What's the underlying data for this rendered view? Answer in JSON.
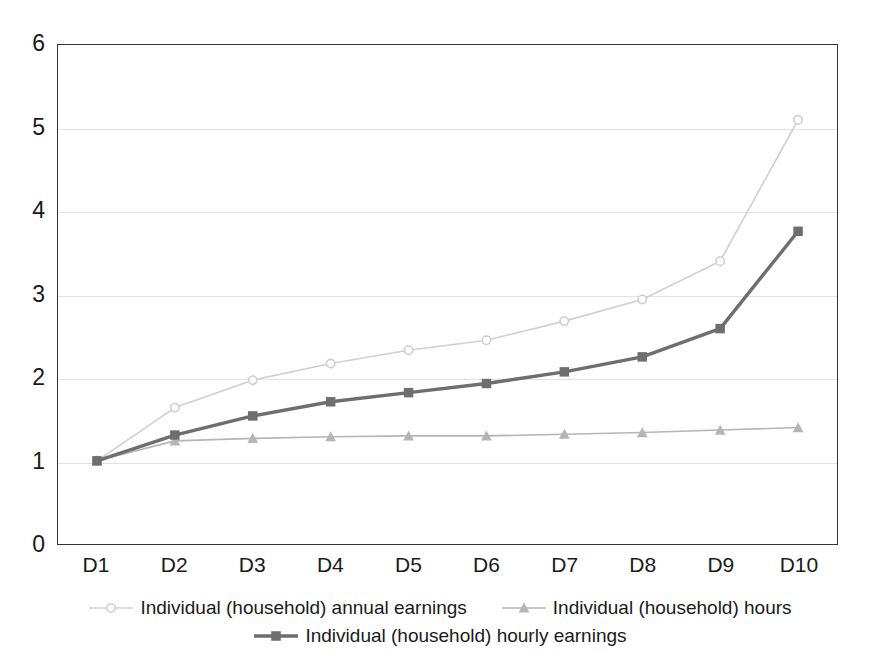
{
  "chart_data": {
    "type": "line",
    "title": "",
    "subtitle": "",
    "xlabel": "",
    "ylabel": "",
    "categories": [
      "D1",
      "D2",
      "D3",
      "D4",
      "D5",
      "D6",
      "D7",
      "D8",
      "D9",
      "D10"
    ],
    "ylim": [
      0,
      6
    ],
    "yticks": [
      0,
      1,
      2,
      3,
      4,
      5,
      6
    ],
    "ytick_labels": [
      "0",
      "1",
      "2",
      "3",
      "4",
      "5",
      "6"
    ],
    "grid": true,
    "grid_axis": "y",
    "legend_position": "bottom",
    "series": [
      {
        "name": "Individual (household) annual earnings",
        "marker": "circle",
        "color": "#cfcfcf",
        "line_width": 1.6,
        "values": [
          1.0,
          1.64,
          1.97,
          2.17,
          2.33,
          2.45,
          2.68,
          2.94,
          3.4,
          5.1
        ]
      },
      {
        "name": "Individual (household) hours",
        "marker": "triangle",
        "color": "#b5b5b5",
        "line_width": 1.6,
        "values": [
          1.0,
          1.24,
          1.27,
          1.29,
          1.3,
          1.3,
          1.32,
          1.34,
          1.37,
          1.4
        ]
      },
      {
        "name": "Individual (household) hourly earnings",
        "marker": "square",
        "color": "#6e6e6e",
        "line_width": 3.4,
        "values": [
          1.0,
          1.31,
          1.54,
          1.71,
          1.82,
          1.93,
          2.07,
          2.25,
          2.59,
          3.76
        ]
      }
    ]
  },
  "axes": {
    "frame_color": "#333333",
    "grid_color": "#e2e2e2"
  },
  "legend": {
    "rows": [
      [
        {
          "label": "Individual (household) annual earnings",
          "series_index": 0
        },
        {
          "label": "Individual (household) hours",
          "series_index": 1
        }
      ],
      [
        {
          "label": "Individual (household) hourly earnings",
          "series_index": 2
        }
      ]
    ]
  }
}
